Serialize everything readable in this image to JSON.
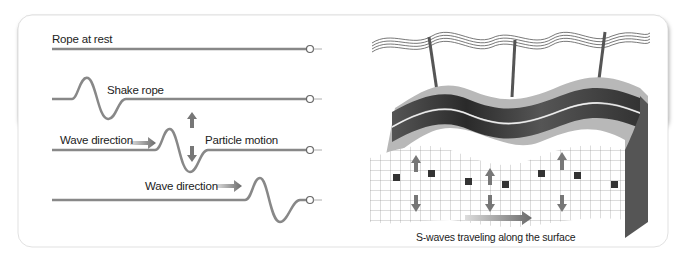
{
  "left_panel": {
    "rows": [
      {
        "label": "Rope at rest"
      },
      {
        "label": "Shake rope"
      },
      {
        "label": "Wave direction",
        "extra_label": "Particle motion"
      },
      {
        "label": "Wave direction"
      }
    ]
  },
  "right_panel": {
    "caption": "S-waves traveling along the surface"
  },
  "colors": {
    "rope": "#8a8a8a",
    "arrow": "#7a7a7a",
    "band_dark": "#3a3a3a",
    "ground": "#b5b5b5"
  }
}
